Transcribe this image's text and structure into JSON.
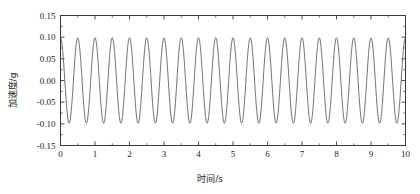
{
  "chart_data": {
    "type": "line",
    "title": "",
    "xlabel": "时间/s",
    "ylabel": "加速度/g",
    "xlim": [
      0,
      10
    ],
    "ylim": [
      -0.15,
      0.15
    ],
    "xticks": [
      0,
      1,
      2,
      3,
      4,
      5,
      6,
      7,
      8,
      9,
      10
    ],
    "xtick_labels": [
      "0",
      "1",
      "2",
      "3",
      "4",
      "5",
      "6",
      "7",
      "8",
      "9",
      "10"
    ],
    "yticks": [
      -0.15,
      -0.1,
      -0.05,
      0.0,
      0.05,
      0.1,
      0.15
    ],
    "ytick_labels": [
      "-0.15",
      "-0.10",
      "-0.05",
      "0.00",
      "0.05",
      "0.10",
      "0.15"
    ],
    "grid": false,
    "legend": null,
    "minor_ticks": true,
    "line_color": "#4a4a4a",
    "axis_color": "#3a3a3a",
    "series": [
      {
        "name": "acceleration",
        "waveform": "cosine",
        "amplitude": 0.0985,
        "frequency_hz": 2.0,
        "phase_deg": 0,
        "offset": 0.0,
        "x_start": 0,
        "x_end": 10,
        "n_points": 2000,
        "description": "约 2 Hz 正弦振动加速度时程，峰值约 ±0.10 g"
      }
    ]
  },
  "axes": {
    "ylabel": "加速度/g",
    "xlabel": "时间/s"
  }
}
